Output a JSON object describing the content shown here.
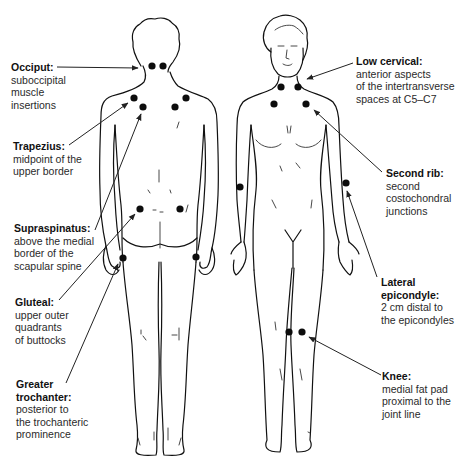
{
  "figure": {
    "views": [
      {
        "name": "posterior",
        "label": "Posterior view"
      },
      {
        "name": "anterior",
        "label": "Anterior view"
      }
    ],
    "colors": {
      "line": "#111111",
      "dot": "#0d0d0d",
      "text": "#2a2a2a",
      "background": "#ffffff"
    }
  },
  "labels": {
    "occiput": {
      "title": "Occiput:",
      "desc": "suboccipital\nmuscle\ninsertions",
      "view": "posterior",
      "side": "left"
    },
    "trapezius": {
      "title": "Trapezius:",
      "desc": "midpoint of the\nupper border",
      "view": "posterior",
      "side": "left"
    },
    "supraspinatus": {
      "title": "Supraspinatus:",
      "desc": "above the medial\nborder of the\nscapular spine",
      "view": "posterior",
      "side": "left"
    },
    "gluteal": {
      "title": "Gluteal:",
      "desc": "upper outer\nquadrants\nof buttocks",
      "view": "posterior",
      "side": "left"
    },
    "greater_trochanter": {
      "title": "Greater\ntrochanter:",
      "desc": "posterior to\nthe trochanteric\nprominence",
      "view": "posterior",
      "side": "left"
    },
    "low_cervical": {
      "title": "Low cervical:",
      "desc": "anterior aspects\nof the intertransverse\nspaces at C5–C7",
      "view": "anterior",
      "side": "right"
    },
    "second_rib": {
      "title": "Second rib:",
      "desc": "second\ncostochondral\njunctions",
      "view": "anterior",
      "side": "right"
    },
    "lateral_epicondyle": {
      "title": "Lateral\nepicondyle:",
      "desc": "2 cm distal to\nthe epicondyles",
      "view": "anterior",
      "side": "right"
    },
    "knee": {
      "title": "Knee:",
      "desc": "medial fat pad\nproximal to the\njoint line",
      "view": "anterior",
      "side": "right"
    }
  },
  "tender_points": {
    "occiput": [
      [
        152,
        66
      ],
      [
        162,
        66
      ]
    ],
    "trapezius": [
      [
        134,
        98
      ],
      [
        186,
        98
      ]
    ],
    "supraspinatus": [
      [
        143,
        106
      ],
      [
        175,
        106
      ]
    ],
    "gluteal": [
      [
        140,
        208
      ],
      [
        180,
        208
      ]
    ],
    "greater_trochanter": [
      [
        123,
        258
      ],
      [
        196,
        256
      ]
    ],
    "low_cervical": [
      [
        281,
        86
      ],
      [
        298,
        86
      ]
    ],
    "second_rib": [
      [
        274,
        103
      ],
      [
        306,
        103
      ]
    ],
    "lateral_epicondyle": [
      [
        240,
        187
      ],
      [
        346,
        183
      ]
    ],
    "knee": [
      [
        289,
        332
      ],
      [
        302,
        332
      ]
    ]
  },
  "tender_point_count": 18
}
